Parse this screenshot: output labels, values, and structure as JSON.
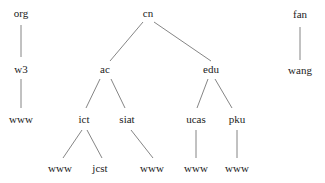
{
  "diagram": {
    "type": "tree",
    "nodes": [
      {
        "id": "org",
        "label": "org",
        "x": 21,
        "y": 13
      },
      {
        "id": "w3",
        "label": "w3",
        "x": 21,
        "y": 69
      },
      {
        "id": "org_www",
        "label": "www",
        "x": 21,
        "y": 119
      },
      {
        "id": "cn",
        "label": "cn",
        "x": 148,
        "y": 13
      },
      {
        "id": "ac",
        "label": "ac",
        "x": 105,
        "y": 69
      },
      {
        "id": "edu",
        "label": "edu",
        "x": 211,
        "y": 69
      },
      {
        "id": "ict",
        "label": "ict",
        "x": 84,
        "y": 119
      },
      {
        "id": "siat",
        "label": "siat",
        "x": 127,
        "y": 119
      },
      {
        "id": "ucas",
        "label": "ucas",
        "x": 196,
        "y": 119
      },
      {
        "id": "pku",
        "label": "pku",
        "x": 237,
        "y": 119
      },
      {
        "id": "ict_www",
        "label": "www",
        "x": 60,
        "y": 168
      },
      {
        "id": "jcst",
        "label": "jcst",
        "x": 100,
        "y": 168
      },
      {
        "id": "siat_www",
        "label": "www",
        "x": 152,
        "y": 168
      },
      {
        "id": "ucas_www",
        "label": "www",
        "x": 196,
        "y": 168
      },
      {
        "id": "pku_www",
        "label": "www",
        "x": 237,
        "y": 168
      },
      {
        "id": "fan",
        "label": "fan",
        "x": 300,
        "y": 14
      },
      {
        "id": "wang",
        "label": "wang",
        "x": 300,
        "y": 70
      }
    ],
    "edges": [
      {
        "x1": 21,
        "y1": 25,
        "x2": 21,
        "y2": 57
      },
      {
        "x1": 21,
        "y1": 79,
        "x2": 21,
        "y2": 108
      },
      {
        "x1": 143,
        "y1": 22,
        "x2": 110,
        "y2": 61
      },
      {
        "x1": 154,
        "y1": 22,
        "x2": 211,
        "y2": 61
      },
      {
        "x1": 100,
        "y1": 79,
        "x2": 86,
        "y2": 108
      },
      {
        "x1": 111,
        "y1": 79,
        "x2": 125,
        "y2": 108
      },
      {
        "x1": 208,
        "y1": 79,
        "x2": 197,
        "y2": 108
      },
      {
        "x1": 215,
        "y1": 79,
        "x2": 232,
        "y2": 108
      },
      {
        "x1": 82,
        "y1": 130,
        "x2": 63,
        "y2": 158
      },
      {
        "x1": 87,
        "y1": 130,
        "x2": 102,
        "y2": 158
      },
      {
        "x1": 131,
        "y1": 130,
        "x2": 153,
        "y2": 158
      },
      {
        "x1": 196,
        "y1": 130,
        "x2": 196,
        "y2": 158
      },
      {
        "x1": 237,
        "y1": 130,
        "x2": 237,
        "y2": 158
      },
      {
        "x1": 300,
        "y1": 27,
        "x2": 300,
        "y2": 60
      }
    ]
  }
}
